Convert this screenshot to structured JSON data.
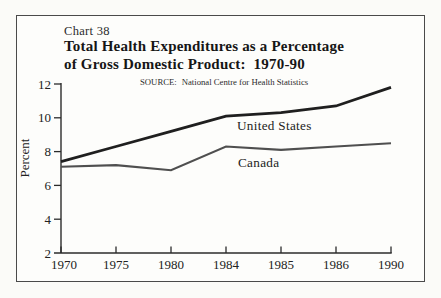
{
  "header": {
    "chart_number": "Chart 38",
    "title_line1": "Total Health Expenditures as a Percentage",
    "title_line2": "of Gross Domestic Product:  1970-90",
    "source_label": "SOURCE:",
    "source_text": "National Centre for Health Statistics"
  },
  "chart_data": {
    "type": "line",
    "source": "National Centre for Health Statistics",
    "xlabel": "",
    "ylabel": "Percent",
    "categories": [
      "1970",
      "1975",
      "1980",
      "1984",
      "1985",
      "1986",
      "1990"
    ],
    "y_ticks": [
      12,
      10,
      8,
      6,
      4,
      2
    ],
    "ylim": [
      2,
      12
    ],
    "grid": false,
    "legend_position": "inline-labels-below-lines",
    "series": [
      {
        "name": "United States",
        "values": [
          7.4,
          8.3,
          9.2,
          10.1,
          10.3,
          10.7,
          11.8
        ],
        "color": "#1f1f1f",
        "stroke_width": 2.8
      },
      {
        "name": "Canada",
        "values": [
          7.1,
          7.2,
          6.9,
          8.3,
          8.1,
          8.3,
          8.5
        ],
        "color": "#4f4f4f",
        "stroke_width": 2.1
      }
    ],
    "series_label_positions": [
      {
        "x": 237,
        "y": 130
      },
      {
        "x": 238,
        "y": 167
      }
    ]
  },
  "colors": {
    "frame_border": "#4a4a4a",
    "axis": "#2b2b2b",
    "text": "#222222",
    "background": "#fdfdfb"
  }
}
